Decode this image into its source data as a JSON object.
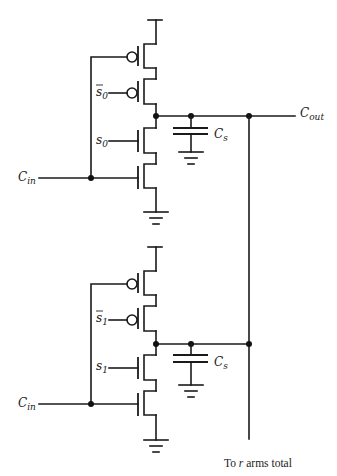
{
  "diagram": {
    "type": "circuit-schematic",
    "colors": {
      "line": "#1a1a1a",
      "background": "#ffffff"
    },
    "arms": [
      {
        "id": "arm-0",
        "input_label": {
          "main": "C",
          "sub": "in"
        },
        "select_bar_label": {
          "main": "s",
          "sub": "0",
          "overbar": true
        },
        "select_label": {
          "main": "s",
          "sub": "0"
        },
        "cap_label": {
          "main": "C",
          "sub": "s"
        }
      },
      {
        "id": "arm-1",
        "input_label": {
          "main": "C",
          "sub": "in"
        },
        "select_bar_label": {
          "main": "s",
          "sub": "1",
          "overbar": true
        },
        "select_label": {
          "main": "s",
          "sub": "1"
        },
        "cap_label": {
          "main": "C",
          "sub": "s"
        }
      }
    ],
    "output_label": {
      "main": "C",
      "sub": "out"
    },
    "bus_caption": {
      "prefix": "To ",
      "italic": "r",
      "suffix": " arms total"
    }
  }
}
